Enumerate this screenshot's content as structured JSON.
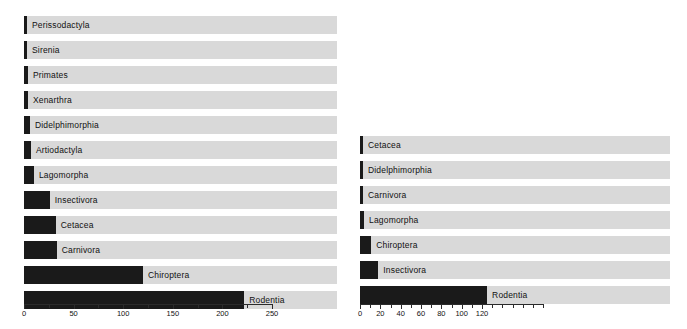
{
  "figure": {
    "background": "#ffffff",
    "bar_color": "#1a1a1a",
    "track_color": "#d9d9d9",
    "axis_color": "#2b2b2b"
  },
  "chart_data": [
    {
      "type": "bar",
      "orientation": "horizontal",
      "panel": "left",
      "title": "",
      "xlabel": "",
      "ylabel": "",
      "xlim": [
        0,
        250
      ],
      "grid": false,
      "legend": false,
      "tick_labels": [
        "0",
        "50",
        "100",
        "150",
        "200",
        "250"
      ],
      "tick_values": [
        0,
        50,
        100,
        150,
        200,
        250
      ],
      "minor_tick_values": [
        25,
        75,
        125,
        175,
        225
      ],
      "categories": [
        "Perissodactyla",
        "Sirenia",
        "Primates",
        "Xenarthra",
        "Didelphimorphia",
        "Artiodactyla",
        "Lagomorpha",
        "Insectivora",
        "Cetacea",
        "Carnivora",
        "Chiroptera",
        "Rodentia"
      ],
      "values": [
        3,
        3,
        4,
        4,
        6,
        7,
        10,
        26,
        32,
        33,
        120,
        222
      ]
    },
    {
      "type": "bar",
      "orientation": "horizontal",
      "panel": "right",
      "title": "",
      "xlabel": "",
      "ylabel": "",
      "xlim": [
        0,
        180
      ],
      "grid": false,
      "legend": false,
      "tick_labels": [
        "0",
        "20",
        "40",
        "60",
        "80",
        "100",
        "120"
      ],
      "tick_values": [
        0,
        20,
        40,
        60,
        80,
        100,
        120
      ],
      "minor_tick_values": [
        10,
        30,
        50,
        70,
        90,
        110,
        130,
        140,
        150,
        160,
        170,
        180
      ],
      "categories": [
        "Cetacea",
        "Didelphimorphia",
        "Carnivora",
        "Lagomorpha",
        "Chiroptera",
        "Insectivora",
        "Rodentia"
      ],
      "values": [
        2,
        2,
        3,
        4,
        11,
        18,
        125
      ]
    }
  ],
  "panels": {
    "left": {
      "rows": [
        {
          "label": "Perissodactyla",
          "value": 3
        },
        {
          "label": "Sirenia",
          "value": 3
        },
        {
          "label": "Primates",
          "value": 4
        },
        {
          "label": "Xenarthra",
          "value": 4
        },
        {
          "label": "Didelphimorphia",
          "value": 6
        },
        {
          "label": "Artiodactyla",
          "value": 7
        },
        {
          "label": "Lagomorpha",
          "value": 10
        },
        {
          "label": "Insectivora",
          "value": 26
        },
        {
          "label": "Cetacea",
          "value": 32
        },
        {
          "label": "Carnivora",
          "value": 33
        },
        {
          "label": "Chiroptera",
          "value": 120
        },
        {
          "label": "Rodentia",
          "value": 222
        }
      ],
      "axis": {
        "labels": [
          "0",
          "50",
          "100",
          "150",
          "200",
          "250"
        ],
        "values": [
          0,
          50,
          100,
          150,
          200,
          250
        ],
        "minors": [
          25,
          75,
          125,
          175,
          225
        ],
        "max": 250
      }
    },
    "right": {
      "rows": [
        {
          "label": "Cetacea",
          "value": 2
        },
        {
          "label": "Didelphimorphia",
          "value": 2
        },
        {
          "label": "Carnivora",
          "value": 3
        },
        {
          "label": "Lagomorpha",
          "value": 4
        },
        {
          "label": "Chiroptera",
          "value": 11
        },
        {
          "label": "Insectivora",
          "value": 18
        },
        {
          "label": "Rodentia",
          "value": 125
        }
      ],
      "axis": {
        "labels": [
          "0",
          "20",
          "40",
          "60",
          "80",
          "100",
          "120"
        ],
        "values": [
          0,
          20,
          40,
          60,
          80,
          100,
          120
        ],
        "minors": [
          10,
          30,
          50,
          70,
          90,
          110,
          130,
          140,
          150,
          160,
          170,
          180
        ],
        "max": 180
      }
    }
  }
}
